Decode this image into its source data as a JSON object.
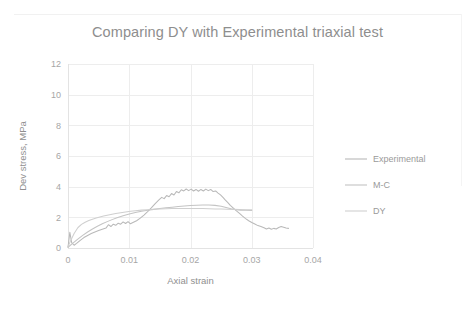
{
  "chart_data": {
    "type": "line",
    "title": "Comparing DY with Experimental triaxial test",
    "xlabel": "Axial strain",
    "ylabel": "Dev stress, MPa",
    "xlim": [
      0,
      0.04
    ],
    "ylim": [
      0,
      12
    ],
    "xticks": [
      "0",
      "0.01",
      "0.02",
      "0.03",
      "0.04"
    ],
    "xtick_values": [
      0,
      0.01,
      0.02,
      0.03,
      0.04
    ],
    "yticks": [
      "0",
      "2",
      "4",
      "6",
      "8",
      "10",
      "12"
    ],
    "ytick_values": [
      0,
      2,
      4,
      6,
      8,
      10,
      12
    ],
    "grid": true,
    "legend_position": "right",
    "colors": {
      "experimental": "#b9b9b9",
      "mc": "#c4c4c4",
      "dy": "#cfcfcf",
      "gridline": "#ededed",
      "text": "#9a9a9a",
      "title": "#8e8e8e",
      "background": "#ffffff"
    },
    "series": [
      {
        "name": "Experimental",
        "color": "#b9b9b9",
        "points": [
          [
            0.0,
            0.05
          ],
          [
            0.0003,
            1.02
          ],
          [
            0.0006,
            0.35
          ],
          [
            0.001,
            0.18
          ],
          [
            0.0014,
            0.3
          ],
          [
            0.002,
            0.5
          ],
          [
            0.0026,
            0.68
          ],
          [
            0.0032,
            0.82
          ],
          [
            0.0038,
            0.95
          ],
          [
            0.0044,
            1.05
          ],
          [
            0.005,
            1.14
          ],
          [
            0.0056,
            1.22
          ],
          [
            0.0062,
            1.3
          ],
          [
            0.0066,
            1.52
          ],
          [
            0.007,
            1.4
          ],
          [
            0.0074,
            1.55
          ],
          [
            0.0078,
            1.48
          ],
          [
            0.0082,
            1.62
          ],
          [
            0.0086,
            1.55
          ],
          [
            0.009,
            1.7
          ],
          [
            0.0094,
            1.6
          ],
          [
            0.0098,
            1.72
          ],
          [
            0.0102,
            1.58
          ],
          [
            0.0106,
            1.66
          ],
          [
            0.0112,
            1.78
          ],
          [
            0.0118,
            1.95
          ],
          [
            0.0124,
            2.15
          ],
          [
            0.013,
            2.38
          ],
          [
            0.0136,
            2.62
          ],
          [
            0.0142,
            2.88
          ],
          [
            0.0148,
            3.12
          ],
          [
            0.0153,
            3.3
          ],
          [
            0.0157,
            3.22
          ],
          [
            0.0161,
            3.42
          ],
          [
            0.0165,
            3.34
          ],
          [
            0.0169,
            3.55
          ],
          [
            0.0173,
            3.46
          ],
          [
            0.0177,
            3.68
          ],
          [
            0.0181,
            3.6
          ],
          [
            0.0185,
            3.8
          ],
          [
            0.0189,
            3.72
          ],
          [
            0.0193,
            3.85
          ],
          [
            0.0197,
            3.74
          ],
          [
            0.0201,
            3.84
          ],
          [
            0.0205,
            3.72
          ],
          [
            0.0209,
            3.82
          ],
          [
            0.0213,
            3.7
          ],
          [
            0.0217,
            3.82
          ],
          [
            0.0221,
            3.72
          ],
          [
            0.0225,
            3.84
          ],
          [
            0.0229,
            3.74
          ],
          [
            0.0233,
            3.82
          ],
          [
            0.0237,
            3.68
          ],
          [
            0.0241,
            3.72
          ],
          [
            0.0245,
            3.58
          ],
          [
            0.0249,
            3.46
          ],
          [
            0.0253,
            3.3
          ],
          [
            0.0257,
            3.12
          ],
          [
            0.0261,
            2.96
          ],
          [
            0.0265,
            2.78
          ],
          [
            0.027,
            2.6
          ],
          [
            0.0275,
            2.42
          ],
          [
            0.028,
            2.26
          ],
          [
            0.0285,
            2.08
          ],
          [
            0.029,
            1.92
          ],
          [
            0.0295,
            1.78
          ],
          [
            0.03,
            1.66
          ],
          [
            0.0305,
            1.56
          ],
          [
            0.031,
            1.46
          ],
          [
            0.0315,
            1.4
          ],
          [
            0.032,
            1.32
          ],
          [
            0.0324,
            1.24
          ],
          [
            0.0328,
            1.3
          ],
          [
            0.0332,
            1.22
          ],
          [
            0.0336,
            1.28
          ],
          [
            0.034,
            1.24
          ],
          [
            0.0344,
            1.34
          ],
          [
            0.0348,
            1.4
          ],
          [
            0.0352,
            1.36
          ],
          [
            0.0356,
            1.3
          ],
          [
            0.036,
            1.28
          ]
        ]
      },
      {
        "name": "M-C",
        "color": "#c4c4c4",
        "points": [
          [
            0.0,
            0.05
          ],
          [
            0.0008,
            0.32
          ],
          [
            0.0016,
            0.58
          ],
          [
            0.0024,
            0.82
          ],
          [
            0.0032,
            1.04
          ],
          [
            0.004,
            1.24
          ],
          [
            0.0048,
            1.42
          ],
          [
            0.0056,
            1.58
          ],
          [
            0.0064,
            1.72
          ],
          [
            0.0072,
            1.85
          ],
          [
            0.008,
            1.97
          ],
          [
            0.009,
            2.1
          ],
          [
            0.01,
            2.21
          ],
          [
            0.011,
            2.31
          ],
          [
            0.012,
            2.39
          ],
          [
            0.013,
            2.46
          ],
          [
            0.014,
            2.52
          ],
          [
            0.015,
            2.57
          ],
          [
            0.016,
            2.62
          ],
          [
            0.017,
            2.66
          ],
          [
            0.018,
            2.7
          ],
          [
            0.019,
            2.74
          ],
          [
            0.02,
            2.77
          ],
          [
            0.021,
            2.79
          ],
          [
            0.022,
            2.81
          ],
          [
            0.023,
            2.81
          ],
          [
            0.024,
            2.78
          ],
          [
            0.025,
            2.72
          ],
          [
            0.0258,
            2.64
          ],
          [
            0.0266,
            2.56
          ],
          [
            0.0274,
            2.5
          ],
          [
            0.0282,
            2.47
          ],
          [
            0.029,
            2.46
          ],
          [
            0.03,
            2.45
          ]
        ]
      },
      {
        "name": "DY",
        "color": "#cfcfcf",
        "points": [
          [
            0.0,
            0.1
          ],
          [
            0.0004,
            0.45
          ],
          [
            0.001,
            0.95
          ],
          [
            0.0016,
            1.32
          ],
          [
            0.0022,
            1.54
          ],
          [
            0.0028,
            1.68
          ],
          [
            0.0034,
            1.79
          ],
          [
            0.004,
            1.88
          ],
          [
            0.0046,
            1.96
          ],
          [
            0.0052,
            2.02
          ],
          [
            0.0058,
            2.08
          ],
          [
            0.0064,
            2.14
          ],
          [
            0.007,
            2.19
          ],
          [
            0.0078,
            2.25
          ],
          [
            0.0086,
            2.3
          ],
          [
            0.0094,
            2.35
          ],
          [
            0.0102,
            2.39
          ],
          [
            0.011,
            2.43
          ],
          [
            0.012,
            2.47
          ],
          [
            0.013,
            2.5
          ],
          [
            0.014,
            2.53
          ],
          [
            0.015,
            2.55
          ],
          [
            0.016,
            2.56
          ],
          [
            0.017,
            2.57
          ],
          [
            0.018,
            2.58
          ],
          [
            0.019,
            2.58
          ],
          [
            0.02,
            2.58
          ],
          [
            0.021,
            2.58
          ],
          [
            0.022,
            2.57
          ],
          [
            0.023,
            2.56
          ],
          [
            0.024,
            2.55
          ],
          [
            0.025,
            2.54
          ],
          [
            0.026,
            2.53
          ],
          [
            0.027,
            2.52
          ],
          [
            0.028,
            2.51
          ],
          [
            0.029,
            2.5
          ],
          [
            0.03,
            2.49
          ]
        ]
      }
    ],
    "legend": [
      {
        "label": "Experimental",
        "color": "#b9b9b9"
      },
      {
        "label": "M-C",
        "color": "#c4c4c4"
      },
      {
        "label": "DY",
        "color": "#cfcfcf"
      }
    ]
  }
}
